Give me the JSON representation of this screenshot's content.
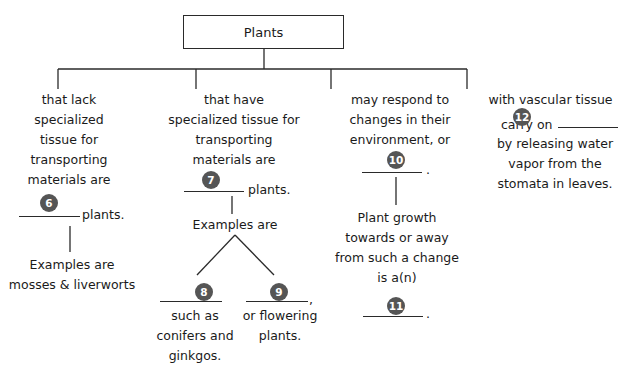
{
  "diagram": {
    "root": {
      "label": "Plants"
    },
    "branches": [
      {
        "lines": [
          "that lack",
          "specialized",
          "tissue for",
          "transporting",
          "materials are"
        ],
        "blank_number": "6",
        "after_blank": "plants.",
        "child": {
          "lines": [
            "Examples are",
            "mosses & liverworts"
          ]
        }
      },
      {
        "lines": [
          "that have",
          "specialized tissue for",
          "transporting",
          "materials are"
        ],
        "blank_number": "7",
        "after_blank": "plants.",
        "child": {
          "label": "Examples are",
          "children": [
            {
              "blank_number": "8",
              "lines": [
                "such as",
                "conifers and",
                "ginkgos."
              ]
            },
            {
              "blank_number": "9",
              "after_blank": ",",
              "lines": [
                "or flowering",
                "plants."
              ]
            }
          ]
        }
      },
      {
        "lines": [
          "may respond to",
          "changes in their",
          "environment, or"
        ],
        "blank_number": "10",
        "after_blank": ".",
        "child": {
          "lines": [
            "Plant growth",
            "towards or away",
            "from such a change",
            "is a(n)"
          ],
          "blank_number": "11",
          "after_blank": "."
        }
      },
      {
        "lines": [
          "with vascular tissue"
        ],
        "line2_prefix": "carry on",
        "blank_number": "12",
        "lines_after": [
          "by releasing water",
          "vapor from the",
          "stomata in leaves."
        ]
      }
    ]
  },
  "colors": {
    "line": "#2a2a2a",
    "badge": "#555555",
    "background": "#ffffff"
  }
}
